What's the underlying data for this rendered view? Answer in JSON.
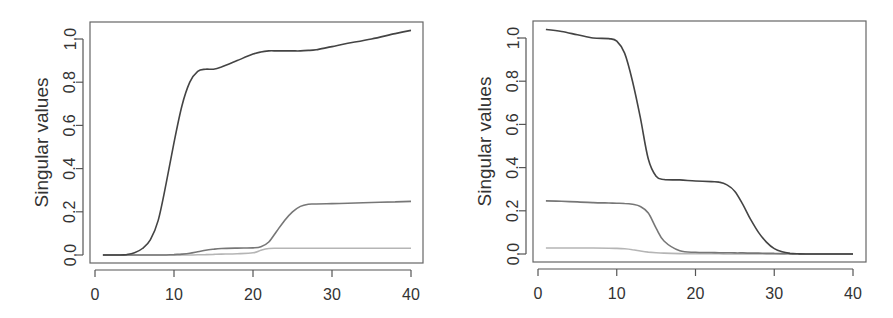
{
  "chart_data": [
    {
      "type": "line",
      "title": "",
      "xlabel": "",
      "ylabel": "Singular values",
      "xlim": [
        0,
        40
      ],
      "ylim": [
        -0.03,
        1.08
      ],
      "xticks": [
        "0",
        "10",
        "20",
        "30",
        "40"
      ],
      "yticks": [
        "0.0",
        "0.2",
        "0.4",
        "0.6",
        "0.8",
        "1.0"
      ],
      "grid": false,
      "legend": null,
      "x": [
        1,
        3,
        4,
        5,
        6,
        7,
        8,
        9,
        10,
        11,
        12,
        13,
        14,
        15,
        16,
        18,
        20,
        21,
        22,
        23,
        24,
        25,
        26,
        27,
        28,
        30,
        32,
        35,
        38,
        40
      ],
      "series": [
        {
          "name": "singular value 1",
          "color": "#444444",
          "values": [
            0.0,
            0.0,
            0.002,
            0.01,
            0.03,
            0.07,
            0.16,
            0.33,
            0.52,
            0.69,
            0.8,
            0.85,
            0.86,
            0.86,
            0.87,
            0.9,
            0.93,
            0.94,
            0.945,
            0.945,
            0.945,
            0.945,
            0.945,
            0.947,
            0.95,
            0.965,
            0.98,
            1.0,
            1.025,
            1.04
          ]
        },
        {
          "name": "singular value 2",
          "color": "#777777",
          "values": [
            0.0,
            0.0,
            0.0,
            0.0,
            0.0,
            0.0,
            0.0,
            0.0,
            0.002,
            0.004,
            0.008,
            0.015,
            0.022,
            0.027,
            0.03,
            0.032,
            0.033,
            0.038,
            0.06,
            0.11,
            0.16,
            0.2,
            0.225,
            0.235,
            0.236,
            0.238,
            0.24,
            0.243,
            0.246,
            0.248
          ]
        },
        {
          "name": "singular value 3",
          "color": "#b5b5b5",
          "values": [
            0.0,
            0.0,
            0.0,
            0.0,
            0.0,
            0.0,
            0.0,
            0.0,
            0.0,
            0.0,
            0.0,
            0.001,
            0.002,
            0.003,
            0.004,
            0.006,
            0.01,
            0.022,
            0.03,
            0.031,
            0.031,
            0.031,
            0.031,
            0.031,
            0.031,
            0.031,
            0.031,
            0.031,
            0.031,
            0.031
          ]
        }
      ]
    },
    {
      "type": "line",
      "title": "",
      "xlabel": "",
      "ylabel": "Singular values",
      "xlim": [
        0,
        40
      ],
      "ylim": [
        -0.03,
        1.08
      ],
      "xticks": [
        "0",
        "10",
        "20",
        "30",
        "40"
      ],
      "yticks": [
        "0.0",
        "0.2",
        "0.4",
        "0.6",
        "0.8",
        "1.0"
      ],
      "grid": false,
      "legend": null,
      "x": [
        1,
        3,
        5,
        7,
        9,
        10,
        11,
        12,
        13,
        14,
        15,
        16,
        18,
        20,
        22,
        23,
        24,
        25,
        26,
        27,
        28,
        29,
        30,
        31,
        32,
        33,
        35,
        40
      ],
      "series": [
        {
          "name": "singular value 1",
          "color": "#444444",
          "values": [
            1.04,
            1.03,
            1.015,
            1.0,
            0.997,
            0.985,
            0.93,
            0.8,
            0.63,
            0.44,
            0.36,
            0.345,
            0.343,
            0.338,
            0.335,
            0.333,
            0.32,
            0.29,
            0.23,
            0.16,
            0.1,
            0.055,
            0.025,
            0.01,
            0.003,
            0.001,
            0.0,
            0.0
          ]
        },
        {
          "name": "singular value 2",
          "color": "#777777",
          "values": [
            0.246,
            0.244,
            0.241,
            0.238,
            0.236,
            0.235,
            0.234,
            0.23,
            0.22,
            0.19,
            0.12,
            0.06,
            0.015,
            0.008,
            0.007,
            0.006,
            0.006,
            0.005,
            0.005,
            0.004,
            0.004,
            0.003,
            0.003,
            0.002,
            0.002,
            0.001,
            0.0,
            0.0
          ]
        },
        {
          "name": "singular value 3",
          "color": "#b5b5b5",
          "values": [
            0.028,
            0.028,
            0.028,
            0.028,
            0.027,
            0.026,
            0.024,
            0.02,
            0.014,
            0.009,
            0.006,
            0.004,
            0.002,
            0.001,
            0.001,
            0.001,
            0.0,
            0.0,
            0.0,
            0.0,
            0.0,
            0.0,
            0.0,
            0.0,
            0.0,
            0.0,
            0.0,
            0.0
          ]
        }
      ]
    }
  ],
  "layout": {
    "panels": [
      {
        "frame": [
          90,
          22,
          423,
          263
        ],
        "x0px": 95,
        "x40px": 411,
        "y0px": 255,
        "y1px": 39,
        "ylabel_x": 48
      },
      {
        "frame": [
          533,
          21,
          866,
          262
        ],
        "x0px": 538,
        "x40px": 853,
        "y0px": 254,
        "y1px": 38,
        "ylabel_x": 491
      }
    ]
  }
}
